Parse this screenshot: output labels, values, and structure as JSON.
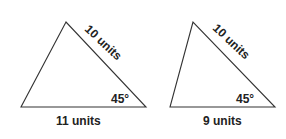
{
  "figures": [
    {
      "side_label": "10 units",
      "base_label": "11 units",
      "angle_label": "45°"
    },
    {
      "side_label": "10 units",
      "base_label": "9 units",
      "angle_label": "45°"
    }
  ]
}
